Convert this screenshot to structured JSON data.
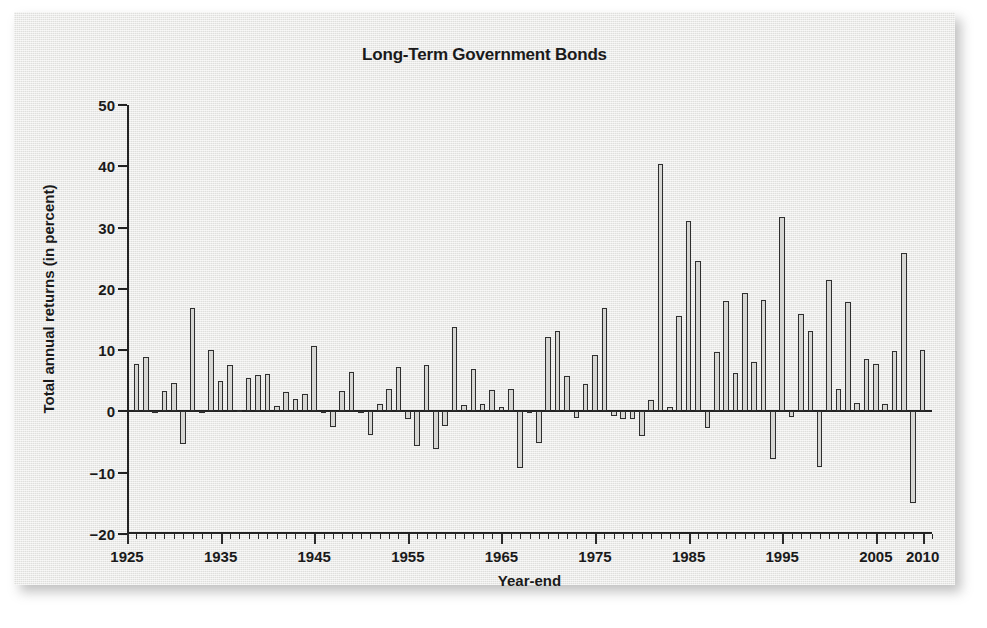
{
  "chart_data": {
    "type": "bar",
    "title": "Long-Term Government Bonds",
    "xlabel": "Year-end",
    "ylabel": "Total annual returns (in percent)",
    "ylim": [
      -20,
      50
    ],
    "yticks": [
      -20,
      -10,
      0,
      10,
      20,
      30,
      40,
      50
    ],
    "ytick_labels": [
      "−20",
      "−10",
      "0",
      "10",
      "20",
      "30",
      "40",
      "50"
    ],
    "xlim": [
      1925,
      2011
    ],
    "xticks": [
      1925,
      1935,
      1945,
      1955,
      1965,
      1975,
      1985,
      1995,
      2005,
      2010
    ],
    "xtick_labels": [
      "1925",
      "1935",
      "1945",
      "1955",
      "1965",
      "1975",
      "1985",
      "1995",
      "2005",
      "2010"
    ],
    "grid": false,
    "legend": "none",
    "bar_fill_color": "#d6d6d3",
    "bar_edge_color": "#2e2e2e",
    "panel_color": "#e9e9e7",
    "axis_color": "#222222",
    "categories": [
      1926,
      1927,
      1928,
      1929,
      1930,
      1931,
      1932,
      1933,
      1934,
      1935,
      1936,
      1937,
      1938,
      1939,
      1940,
      1941,
      1942,
      1943,
      1944,
      1945,
      1946,
      1947,
      1948,
      1949,
      1950,
      1951,
      1952,
      1953,
      1954,
      1955,
      1956,
      1957,
      1958,
      1959,
      1960,
      1961,
      1962,
      1963,
      1964,
      1965,
      1966,
      1967,
      1968,
      1969,
      1970,
      1971,
      1972,
      1973,
      1974,
      1975,
      1976,
      1977,
      1978,
      1979,
      1980,
      1981,
      1982,
      1983,
      1984,
      1985,
      1986,
      1987,
      1988,
      1989,
      1990,
      1991,
      1992,
      1993,
      1994,
      1995,
      1996,
      1997,
      1998,
      1999,
      2000,
      2001,
      2002,
      2003,
      2004,
      2005,
      2006,
      2007,
      2008,
      2009,
      2010
    ],
    "values": [
      7.8,
      8.9,
      0.1,
      3.4,
      4.7,
      -5.3,
      16.8,
      -0.1,
      10.0,
      5.0,
      7.5,
      0.2,
      5.5,
      5.9,
      6.1,
      0.9,
      3.2,
      2.1,
      2.8,
      10.7,
      -0.1,
      -2.6,
      3.4,
      6.4,
      0.1,
      -3.9,
      1.2,
      3.6,
      7.2,
      -1.3,
      -5.6,
      7.5,
      -6.1,
      -2.3,
      13.8,
      1.0,
      6.9,
      1.2,
      3.5,
      0.7,
      3.6,
      -9.2,
      -0.3,
      -5.1,
      12.1,
      13.2,
      5.7,
      -1.1,
      4.4,
      9.2,
      16.8,
      -0.7,
      -1.2,
      -1.2,
      -4.0,
      1.9,
      40.4,
      0.7,
      15.5,
      31.0,
      24.5,
      -2.7,
      9.7,
      18.1,
      6.2,
      19.3,
      8.1,
      18.2,
      -7.8,
      31.7,
      -0.9,
      15.9,
      13.1,
      -9.0,
      21.5,
      3.7,
      17.8,
      1.4,
      8.5,
      7.8,
      1.2,
      9.9,
      25.9,
      -14.9,
      10.1
    ]
  }
}
